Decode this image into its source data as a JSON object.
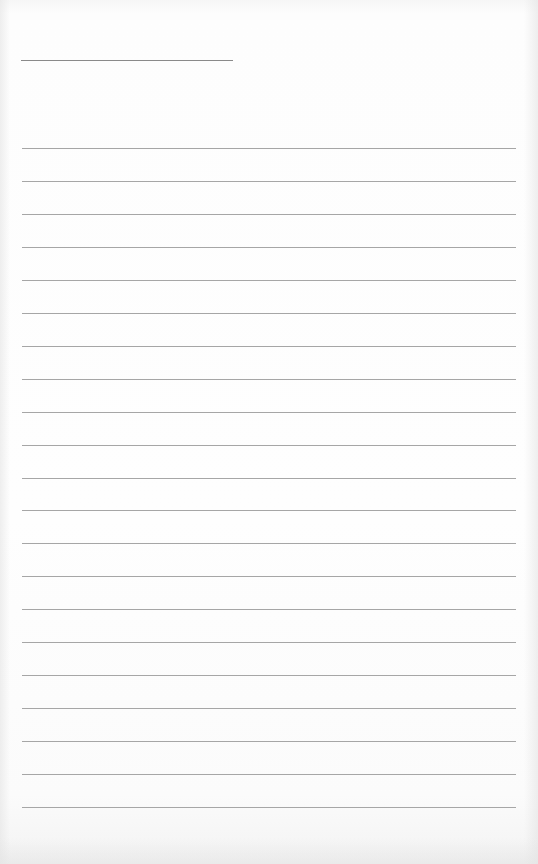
{
  "document": {
    "type": "blank lined writing sheet",
    "header_line": {
      "present": true
    },
    "ruled_lines": {
      "count": 21,
      "first_y": 148,
      "spacing": 32.95,
      "color": "#a6a6a6"
    },
    "text": []
  }
}
